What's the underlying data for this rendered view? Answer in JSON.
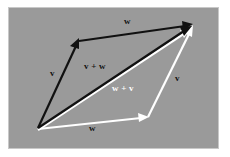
{
  "figure": {
    "kind": "vector-addition-parallelogram",
    "background_color": "#9a9a9a",
    "page_color": "#ffffff",
    "border_color": "#c8c8c8",
    "black_color": "#111111",
    "white_color": "#ffffff"
  },
  "labels": {
    "w_top": "w",
    "v_left": "v",
    "v_plus_w": "v + w",
    "w_plus_v": "w + v",
    "v_right": "v",
    "w_bottom": "w"
  },
  "vectors": [
    {
      "name": "v-black",
      "label": "v",
      "color": "#111111",
      "from": [
        38,
        128
      ],
      "to": [
        78,
        40
      ]
    },
    {
      "name": "w-black",
      "label": "w",
      "color": "#111111",
      "from": [
        78,
        40
      ],
      "to": [
        192,
        24
      ]
    },
    {
      "name": "v-plus-w-black",
      "label": "v + w",
      "color": "#111111",
      "from": [
        38,
        128
      ],
      "to": [
        192,
        26
      ]
    },
    {
      "name": "w-white",
      "label": "w",
      "color": "#ffffff",
      "from": [
        38,
        129
      ],
      "to": [
        148,
        117
      ]
    },
    {
      "name": "v-white",
      "label": "v",
      "color": "#ffffff",
      "from": [
        148,
        117
      ],
      "to": [
        192,
        28
      ]
    },
    {
      "name": "w-plus-v-white",
      "label": "w + v",
      "color": "#ffffff",
      "from": [
        38,
        130
      ],
      "to": [
        191,
        29
      ]
    }
  ]
}
